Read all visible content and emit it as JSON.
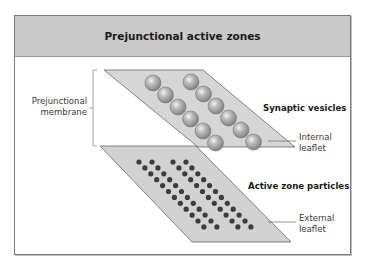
{
  "figure": {
    "title": "Prejunctional active zones"
  },
  "labels": {
    "prejunctional_membrane_line1": "Prejunctional",
    "prejunctional_membrane_line2": "membrane",
    "synaptic_vesicles": "Synaptic vesicles",
    "internal_leaflet_line1": "Internal",
    "internal_leaflet_line2": "leaflet",
    "active_zone_particles": "Active zone particles",
    "external_leaflet_line1": "External",
    "external_leaflet_line2": "leaflet"
  },
  "colors": {
    "header_bg": "#c9c9c9",
    "plate_fill": "#d4d4d4",
    "plate_edge": "#555555",
    "vesicle": "#9a9a9a",
    "particle": "#3c3c3c"
  },
  "structure": {
    "vesicle_rows": 2,
    "vesicles_per_row": 6,
    "particle_double_rows": 2,
    "particles_per_line": 12
  }
}
